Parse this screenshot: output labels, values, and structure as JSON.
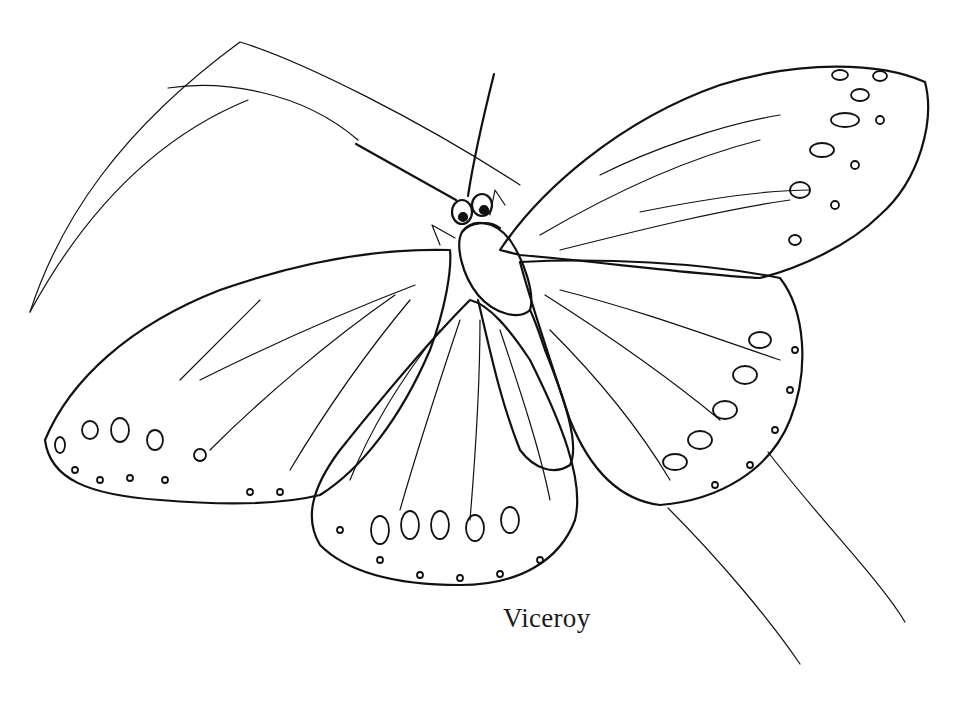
{
  "illustration": {
    "subject": "butterfly-line-drawing",
    "caption": "Viceroy",
    "style": "black ink outline coloring page",
    "colors": {
      "ink": "#111111",
      "background": "#ffffff"
    }
  }
}
